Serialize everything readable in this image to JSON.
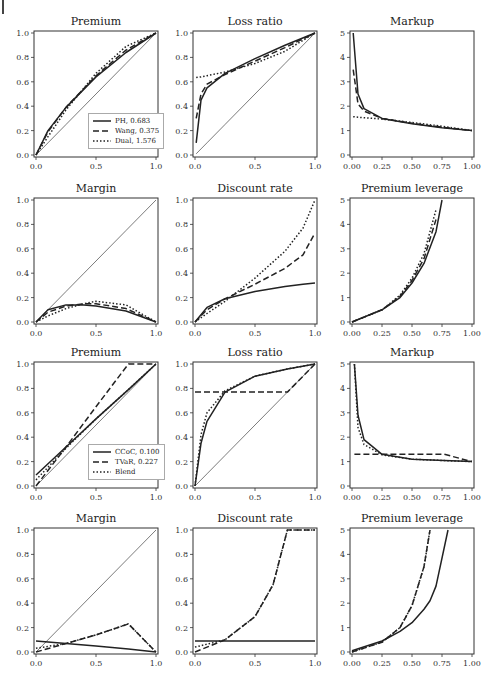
{
  "page": {
    "marker": "|"
  },
  "legends": {
    "top": [
      {
        "label": "PH, 0.683",
        "style": "solid"
      },
      {
        "label": "Wang, 0.375",
        "style": "dashed"
      },
      {
        "label": "Dual, 1.576",
        "style": "dotted"
      }
    ],
    "bottom": [
      {
        "label": "CCoC, 0.100",
        "style": "solid"
      },
      {
        "label": "TVaR, 0.227",
        "style": "dashed"
      },
      {
        "label": "Blend",
        "style": "dotted"
      }
    ]
  },
  "panels": [
    {
      "id": "r1c1",
      "title": "Premium"
    },
    {
      "id": "r1c2",
      "title": "Loss ratio"
    },
    {
      "id": "r1c3",
      "title": "Markup"
    },
    {
      "id": "r2c1",
      "title": "Margin"
    },
    {
      "id": "r2c2",
      "title": "Discount rate"
    },
    {
      "id": "r2c3",
      "title": "Premium leverage"
    },
    {
      "id": "r3c1",
      "title": "Premium"
    },
    {
      "id": "r3c2",
      "title": "Loss ratio"
    },
    {
      "id": "r3c3",
      "title": "Markup"
    },
    {
      "id": "r4c1",
      "title": "Margin"
    },
    {
      "id": "r4c2",
      "title": "Discount rate"
    },
    {
      "id": "r4c3",
      "title": "Premium leverage"
    }
  ],
  "chart_data": [
    {
      "type": "line",
      "title": "Premium",
      "xlim": [
        0,
        1
      ],
      "ylim": [
        0,
        1
      ],
      "xticks": [
        "0.0",
        "0.5",
        "1.0"
      ],
      "yticks": [
        "0.0",
        "0.2",
        "0.4",
        "0.6",
        "0.8",
        "1.0"
      ],
      "legend": [
        "PH, 0.683",
        "Wang, 0.375",
        "Dual, 1.576"
      ],
      "legend_position": "lower right",
      "x": [
        0,
        0.1,
        0.25,
        0.5,
        0.75,
        1
      ],
      "series": [
        {
          "name": "diagonal",
          "style": "thin",
          "values": [
            0,
            0.1,
            0.25,
            0.5,
            0.75,
            1
          ]
        },
        {
          "name": "PH, 0.683",
          "style": "solid",
          "values": [
            0,
            0.2,
            0.39,
            0.64,
            0.84,
            1
          ]
        },
        {
          "name": "Wang, 0.375",
          "style": "dashed",
          "values": [
            0,
            0.19,
            0.39,
            0.65,
            0.86,
            1
          ]
        },
        {
          "name": "Dual, 1.576",
          "style": "dotted",
          "values": [
            0,
            0.15,
            0.37,
            0.67,
            0.89,
            1
          ]
        }
      ]
    },
    {
      "type": "line",
      "title": "Loss ratio",
      "xlim": [
        0,
        1
      ],
      "ylim": [
        0,
        1
      ],
      "xticks": [
        "0.0",
        "0.5",
        "1.0"
      ],
      "yticks": [
        "0.0",
        "0.2",
        "0.4",
        "0.6",
        "0.8",
        "1.0"
      ],
      "x": [
        0.01,
        0.05,
        0.1,
        0.25,
        0.5,
        0.75,
        1
      ],
      "series": [
        {
          "name": "diagonal",
          "style": "thin",
          "values": [
            0.01,
            0.05,
            0.1,
            0.25,
            0.5,
            0.75,
            1
          ]
        },
        {
          "name": "PH, 0.683",
          "style": "solid",
          "values": [
            0.1,
            0.45,
            0.55,
            0.67,
            0.79,
            0.9,
            1
          ]
        },
        {
          "name": "Wang, 0.375",
          "style": "dashed",
          "values": [
            0.3,
            0.5,
            0.58,
            0.66,
            0.77,
            0.88,
            1
          ]
        },
        {
          "name": "Dual, 1.576",
          "style": "dotted",
          "values": [
            0.635,
            0.64,
            0.65,
            0.68,
            0.75,
            0.85,
            1
          ]
        }
      ]
    },
    {
      "type": "line",
      "title": "Markup",
      "xlim": [
        0,
        1
      ],
      "ylim": [
        0,
        5
      ],
      "xticks": [
        "0.00",
        "0.25",
        "0.50",
        "0.75",
        "1.00"
      ],
      "yticks": [
        "0",
        "1",
        "2",
        "3",
        "4",
        "5"
      ],
      "x": [
        0.01,
        0.05,
        0.1,
        0.25,
        0.5,
        0.75,
        1
      ],
      "series": [
        {
          "name": "PH, 0.683",
          "style": "solid",
          "values": [
            5,
            2.5,
            1.9,
            1.5,
            1.28,
            1.12,
            1
          ]
        },
        {
          "name": "Wang, 0.375",
          "style": "dashed",
          "values": [
            3.5,
            2.1,
            1.8,
            1.5,
            1.3,
            1.14,
            1
          ]
        },
        {
          "name": "Dual, 1.576",
          "style": "dotted",
          "values": [
            1.57,
            1.55,
            1.53,
            1.47,
            1.33,
            1.18,
            1
          ]
        }
      ]
    },
    {
      "type": "line",
      "title": "Margin",
      "xlim": [
        0,
        1
      ],
      "ylim": [
        0,
        1
      ],
      "xticks": [
        "0.0",
        "0.5",
        "1.0"
      ],
      "yticks": [
        "0.0",
        "0.2",
        "0.4",
        "0.6",
        "0.8",
        "1.0"
      ],
      "x": [
        0,
        0.1,
        0.25,
        0.4,
        0.5,
        0.75,
        1
      ],
      "series": [
        {
          "name": "diagonal",
          "style": "thin",
          "values": [
            0,
            0.1,
            0.25,
            0.4,
            0.5,
            0.75,
            1
          ]
        },
        {
          "name": "PH, 0.683",
          "style": "solid",
          "values": [
            0,
            0.1,
            0.14,
            0.14,
            0.13,
            0.09,
            0
          ]
        },
        {
          "name": "Wang, 0.375",
          "style": "dashed",
          "values": [
            0,
            0.08,
            0.13,
            0.15,
            0.15,
            0.11,
            0
          ]
        },
        {
          "name": "Dual, 1.576",
          "style": "dotted",
          "values": [
            0,
            0.05,
            0.11,
            0.15,
            0.17,
            0.14,
            0
          ]
        }
      ]
    },
    {
      "type": "line",
      "title": "Discount rate",
      "xlim": [
        0,
        1
      ],
      "ylim": [
        0,
        1
      ],
      "xticks": [
        "0.0",
        "0.5",
        "1.0"
      ],
      "yticks": [
        "0.0",
        "0.2",
        "0.4",
        "0.6",
        "0.8",
        "1.0"
      ],
      "x": [
        0,
        0.1,
        0.25,
        0.5,
        0.75,
        0.9,
        1
      ],
      "series": [
        {
          "name": "PH, 0.683",
          "style": "solid",
          "values": [
            0,
            0.12,
            0.19,
            0.25,
            0.29,
            0.31,
            0.32
          ]
        },
        {
          "name": "Wang, 0.375",
          "style": "dashed",
          "values": [
            0,
            0.1,
            0.19,
            0.31,
            0.44,
            0.55,
            0.73
          ]
        },
        {
          "name": "Dual, 1.576",
          "style": "dotted",
          "values": [
            0,
            0.07,
            0.17,
            0.36,
            0.58,
            0.77,
            1.0
          ]
        }
      ]
    },
    {
      "type": "line",
      "title": "Premium leverage",
      "xlim": [
        0,
        1
      ],
      "ylim": [
        0,
        5
      ],
      "xticks": [
        "0.00",
        "0.25",
        "0.50",
        "0.75",
        "1.00"
      ],
      "yticks": [
        "0",
        "1",
        "2",
        "3",
        "4",
        "5"
      ],
      "x": [
        0,
        0.25,
        0.4,
        0.5,
        0.6,
        0.7,
        0.75,
        0.8
      ],
      "series": [
        {
          "name": "PH, 0.683",
          "style": "solid",
          "values": [
            0,
            0.5,
            1.0,
            1.6,
            2.4,
            3.7,
            5,
            null
          ]
        },
        {
          "name": "Wang, 0.375",
          "style": "dashed",
          "values": [
            0,
            0.5,
            1.05,
            1.7,
            2.6,
            4.2,
            null,
            null
          ]
        },
        {
          "name": "Dual, 1.576",
          "style": "dotted",
          "values": [
            0,
            0.5,
            1.1,
            1.8,
            2.8,
            4.6,
            null,
            null
          ]
        }
      ]
    },
    {
      "type": "line",
      "title": "Premium",
      "xlim": [
        0,
        1
      ],
      "ylim": [
        0,
        1
      ],
      "xticks": [
        "0.0",
        "0.5",
        "1.0"
      ],
      "yticks": [
        "0.0",
        "0.2",
        "0.4",
        "0.6",
        "0.8",
        "1.0"
      ],
      "legend": [
        "CCoC, 0.100",
        "TVaR, 0.227",
        "Blend"
      ],
      "legend_position": "lower right",
      "x": [
        0,
        0.25,
        0.5,
        0.77,
        1
      ],
      "series": [
        {
          "name": "diagonal",
          "style": "thin",
          "values": [
            0,
            0.25,
            0.5,
            0.77,
            1
          ]
        },
        {
          "name": "CCoC, 0.100",
          "style": "solid",
          "values": [
            0.09,
            0.32,
            0.55,
            0.79,
            1
          ]
        },
        {
          "name": "TVaR, 0.227",
          "style": "dashed",
          "values": [
            0,
            0.32,
            0.65,
            1.0,
            1.0
          ]
        },
        {
          "name": "Blend",
          "style": "dotted",
          "values": [
            0.05,
            0.31,
            0.55,
            0.79,
            1
          ]
        }
      ]
    },
    {
      "type": "line",
      "title": "Loss ratio",
      "xlim": [
        0,
        1
      ],
      "ylim": [
        0,
        1
      ],
      "xticks": [
        "0.0",
        "0.5",
        "1.0"
      ],
      "yticks": [
        "0.0",
        "0.2",
        "0.4",
        "0.6",
        "0.8",
        "1.0"
      ],
      "x": [
        0,
        0.05,
        0.1,
        0.25,
        0.5,
        0.77,
        1
      ],
      "series": [
        {
          "name": "diagonal",
          "style": "thin",
          "values": [
            0,
            0.05,
            0.1,
            0.25,
            0.5,
            0.77,
            1
          ]
        },
        {
          "name": "CCoC, 0.100",
          "style": "solid",
          "values": [
            0,
            0.35,
            0.53,
            0.77,
            0.9,
            0.96,
            1
          ]
        },
        {
          "name": "TVaR, 0.227",
          "style": "dashed",
          "values": [
            0.77,
            0.77,
            0.77,
            0.77,
            0.77,
            0.77,
            1
          ]
        },
        {
          "name": "Blend",
          "style": "dotted",
          "values": [
            0,
            0.42,
            0.6,
            0.78,
            0.9,
            0.96,
            1
          ]
        }
      ]
    },
    {
      "type": "line",
      "title": "Markup",
      "xlim": [
        0,
        1
      ],
      "ylim": [
        0,
        5
      ],
      "xticks": [
        "0.00",
        "0.25",
        "0.50",
        "0.75",
        "1.00"
      ],
      "yticks": [
        "0",
        "1",
        "2",
        "3",
        "4",
        "5"
      ],
      "x": [
        0.02,
        0.05,
        0.1,
        0.25,
        0.5,
        0.77,
        1
      ],
      "series": [
        {
          "name": "CCoC, 0.100",
          "style": "solid",
          "values": [
            5,
            2.9,
            1.9,
            1.3,
            1.1,
            1.04,
            1
          ]
        },
        {
          "name": "TVaR, 0.227",
          "style": "dashed",
          "values": [
            1.3,
            1.3,
            1.3,
            1.3,
            1.3,
            1.3,
            1
          ]
        },
        {
          "name": "Blend",
          "style": "dotted",
          "values": [
            5,
            2.4,
            1.7,
            1.28,
            1.1,
            1.04,
            1
          ]
        }
      ]
    },
    {
      "type": "line",
      "title": "Margin",
      "xlim": [
        0,
        1
      ],
      "ylim": [
        0,
        1
      ],
      "xticks": [
        "0.0",
        "0.5",
        "1.0"
      ],
      "yticks": [
        "0.0",
        "0.2",
        "0.4",
        "0.6",
        "0.8",
        "1.0"
      ],
      "x": [
        0,
        0.25,
        0.5,
        0.77,
        1
      ],
      "series": [
        {
          "name": "diagonal",
          "style": "thin",
          "values": [
            0,
            0.25,
            0.5,
            0.77,
            1
          ]
        },
        {
          "name": "CCoC, 0.100",
          "style": "solid",
          "values": [
            0.09,
            0.07,
            0.05,
            0.025,
            0
          ]
        },
        {
          "name": "TVaR, 0.227",
          "style": "dashed",
          "values": [
            0,
            0.07,
            0.14,
            0.23,
            0
          ]
        },
        {
          "name": "Blend",
          "style": "dotted",
          "values": [
            0.03,
            0.07,
            0.14,
            0.23,
            0
          ]
        }
      ]
    },
    {
      "type": "line",
      "title": "Discount rate",
      "xlim": [
        0,
        1
      ],
      "ylim": [
        0,
        1
      ],
      "xticks": [
        "0.0",
        "0.5",
        "1.0"
      ],
      "yticks": [
        "0.0",
        "0.2",
        "0.4",
        "0.6",
        "0.8",
        "1.0"
      ],
      "x": [
        0,
        0.25,
        0.5,
        0.65,
        0.77,
        1
      ],
      "series": [
        {
          "name": "CCoC, 0.100",
          "style": "solid",
          "values": [
            0.09,
            0.09,
            0.09,
            0.09,
            0.09,
            0.09
          ]
        },
        {
          "name": "TVaR, 0.227",
          "style": "dashed",
          "values": [
            0,
            0.1,
            0.29,
            0.55,
            1.0,
            1.0
          ]
        },
        {
          "name": "Blend",
          "style": "dotted",
          "values": [
            0.04,
            0.1,
            0.29,
            0.55,
            1.0,
            1.0
          ]
        }
      ]
    },
    {
      "type": "line",
      "title": "Premium leverage",
      "xlim": [
        0,
        1
      ],
      "ylim": [
        0,
        5
      ],
      "xticks": [
        "0.00",
        "0.25",
        "0.50",
        "0.75",
        "1.00"
      ],
      "yticks": [
        "0",
        "1",
        "2",
        "3",
        "4",
        "5"
      ],
      "x": [
        0,
        0.25,
        0.4,
        0.5,
        0.6,
        0.65,
        0.7,
        0.8
      ],
      "series": [
        {
          "name": "CCoC, 0.100",
          "style": "solid",
          "values": [
            0.05,
            0.45,
            0.85,
            1.2,
            1.75,
            2.1,
            2.7,
            5
          ]
        },
        {
          "name": "TVaR, 0.227",
          "style": "dashed",
          "values": [
            0,
            0.4,
            1.0,
            1.9,
            3.5,
            5,
            null,
            null
          ]
        },
        {
          "name": "Blend",
          "style": "dotted",
          "values": [
            0,
            0.4,
            1.0,
            1.9,
            3.5,
            5,
            null,
            null
          ]
        }
      ]
    }
  ]
}
